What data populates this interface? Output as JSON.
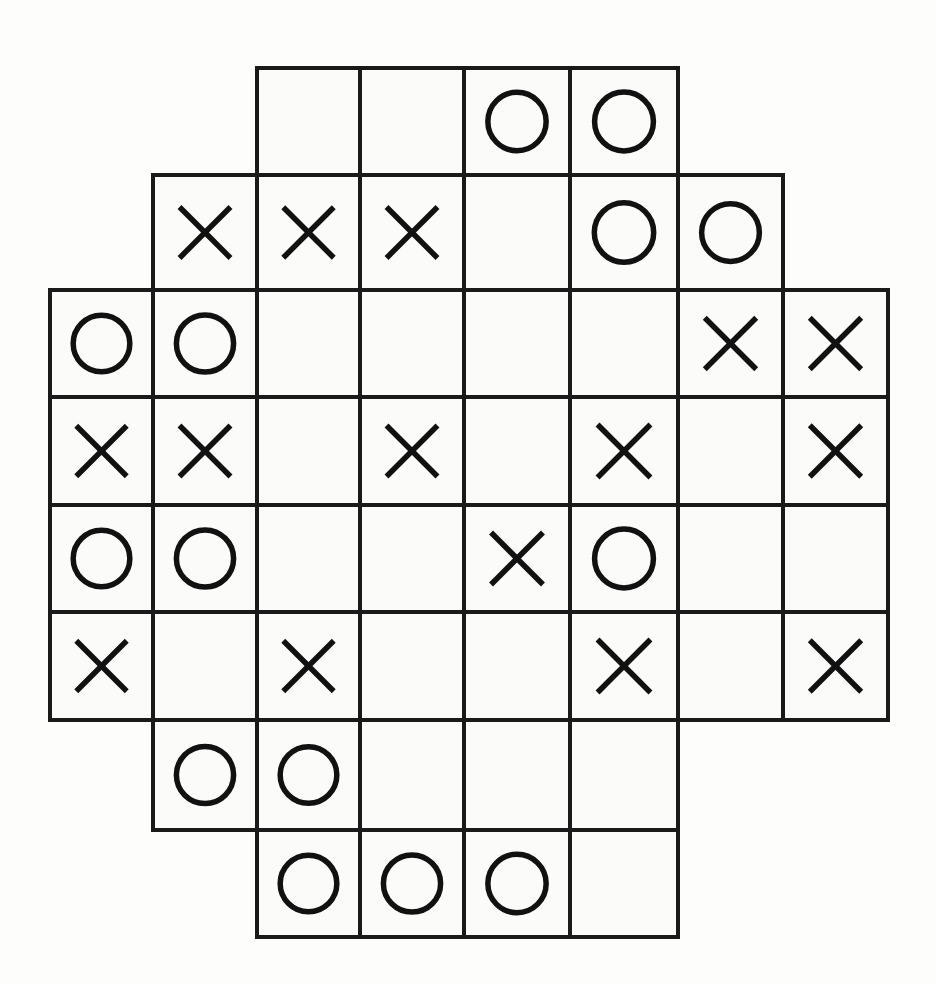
{
  "board": {
    "title": "Octagonal Tic-Tac-Toe Grid",
    "columns": 8,
    "rows": 8,
    "line_color": "#1a1a1a",
    "mark_color": "#111111",
    "background_color": "#fdfdfc",
    "cell_fill": "#fbfbfa",
    "col_edges": [
      50,
      153,
      257,
      360,
      464,
      570,
      678,
      783,
      888
    ],
    "row_edges": [
      68,
      175,
      290,
      397,
      505,
      612,
      720,
      830,
      937
    ],
    "symbols": {
      "x": "X",
      "o": "O",
      "empty": ""
    },
    "rows_data": [
      {
        "index": 0,
        "start_col": 2,
        "end_col": 5,
        "cells": [
          "",
          "",
          "O",
          "O"
        ]
      },
      {
        "index": 1,
        "start_col": 1,
        "end_col": 6,
        "cells": [
          "X",
          "X",
          "X",
          "",
          "O",
          "O"
        ]
      },
      {
        "index": 2,
        "start_col": 0,
        "end_col": 7,
        "cells": [
          "O",
          "O",
          "",
          "",
          "",
          "",
          "X",
          "X"
        ]
      },
      {
        "index": 3,
        "start_col": 0,
        "end_col": 7,
        "cells": [
          "X",
          "X",
          "",
          "X",
          "",
          "X",
          "",
          "X"
        ]
      },
      {
        "index": 4,
        "start_col": 0,
        "end_col": 7,
        "cells": [
          "O",
          "O",
          "",
          "",
          "X",
          "O",
          "",
          ""
        ]
      },
      {
        "index": 5,
        "start_col": 0,
        "end_col": 7,
        "cells": [
          "X",
          "",
          "X",
          "",
          "",
          "X",
          "",
          "X"
        ]
      },
      {
        "index": 6,
        "start_col": 1,
        "end_col": 5,
        "cells": [
          "O",
          "O",
          "",
          "",
          ""
        ]
      },
      {
        "index": 7,
        "start_col": 2,
        "end_col": 5,
        "cells": [
          "O",
          "O",
          "O",
          ""
        ]
      }
    ],
    "counts": {
      "x_total": "16",
      "o_total": "14",
      "cells_total": "50"
    }
  }
}
